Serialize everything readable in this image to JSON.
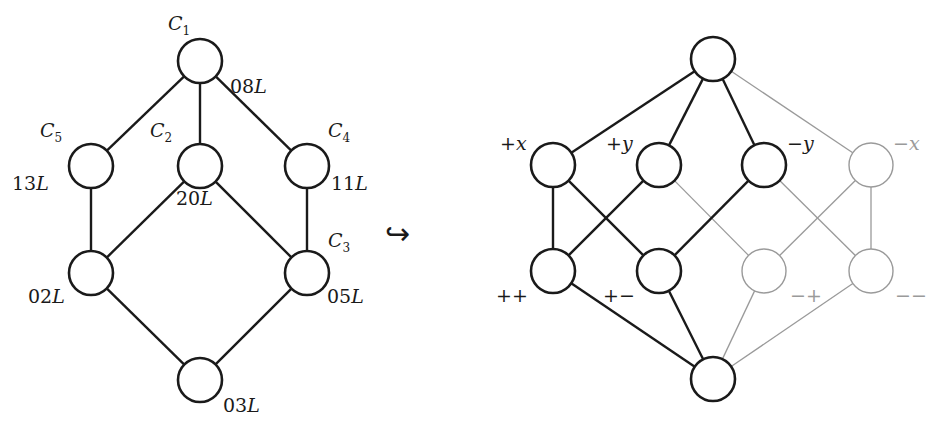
{
  "left_graph": {
    "nodes": [
      {
        "id": "C1",
        "name": "C",
        "sub": "1",
        "value": "08",
        "unit": "L"
      },
      {
        "id": "C5",
        "name": "C",
        "sub": "5",
        "value": "13",
        "unit": "L"
      },
      {
        "id": "C2",
        "name": "C",
        "sub": "2",
        "value": "20",
        "unit": "L"
      },
      {
        "id": "C4",
        "name": "C",
        "sub": "4",
        "value": "11",
        "unit": "L"
      },
      {
        "id": "C6",
        "name": "",
        "sub": "",
        "value": "02",
        "unit": "L"
      },
      {
        "id": "C3",
        "name": "C",
        "sub": "3",
        "value": "05",
        "unit": "L"
      },
      {
        "id": "C7",
        "name": "",
        "sub": "",
        "value": "03",
        "unit": "L"
      }
    ],
    "edges": [
      [
        "C1",
        "C5"
      ],
      [
        "C1",
        "C2"
      ],
      [
        "C1",
        "C4"
      ],
      [
        "C5",
        "C6"
      ],
      [
        "C2",
        "C6"
      ],
      [
        "C2",
        "C3"
      ],
      [
        "C4",
        "C3"
      ],
      [
        "C6",
        "C7"
      ],
      [
        "C3",
        "C7"
      ]
    ]
  },
  "arrow": {
    "symbol": "↪",
    "meaning": "hook-arrow-embedding"
  },
  "right_graph": {
    "nodes": [
      {
        "id": "top",
        "label": "",
        "style": "dark"
      },
      {
        "id": "px",
        "label": "+x",
        "style": "dark"
      },
      {
        "id": "py",
        "label": "+y",
        "style": "dark"
      },
      {
        "id": "my",
        "label": "−y",
        "style": "dark"
      },
      {
        "id": "mx",
        "label": "−x",
        "style": "light"
      },
      {
        "id": "pp",
        "label": "++",
        "style": "dark"
      },
      {
        "id": "pm",
        "label": "+−",
        "style": "dark"
      },
      {
        "id": "mp",
        "label": "−+",
        "style": "light"
      },
      {
        "id": "mm",
        "label": "−−",
        "style": "light"
      },
      {
        "id": "bot",
        "label": "",
        "style": "dark"
      }
    ],
    "edges": [
      {
        "from": "top",
        "to": "px",
        "style": "dark"
      },
      {
        "from": "top",
        "to": "py",
        "style": "dark"
      },
      {
        "from": "top",
        "to": "my",
        "style": "dark"
      },
      {
        "from": "top",
        "to": "mx",
        "style": "light"
      },
      {
        "from": "px",
        "to": "pp",
        "style": "dark"
      },
      {
        "from": "px",
        "to": "pm",
        "style": "dark"
      },
      {
        "from": "py",
        "to": "pp",
        "style": "dark"
      },
      {
        "from": "py",
        "to": "mp",
        "style": "light"
      },
      {
        "from": "my",
        "to": "pm",
        "style": "dark"
      },
      {
        "from": "my",
        "to": "mm",
        "style": "light"
      },
      {
        "from": "mx",
        "to": "mp",
        "style": "light"
      },
      {
        "from": "mx",
        "to": "mm",
        "style": "light"
      },
      {
        "from": "pp",
        "to": "bot",
        "style": "dark"
      },
      {
        "from": "pm",
        "to": "bot",
        "style": "dark"
      },
      {
        "from": "mp",
        "to": "bot",
        "style": "light"
      },
      {
        "from": "mm",
        "to": "bot",
        "style": "light"
      }
    ]
  },
  "colors": {
    "dark": "#1a1a1a",
    "light": "#9a9a9a",
    "background": "#ffffff"
  }
}
